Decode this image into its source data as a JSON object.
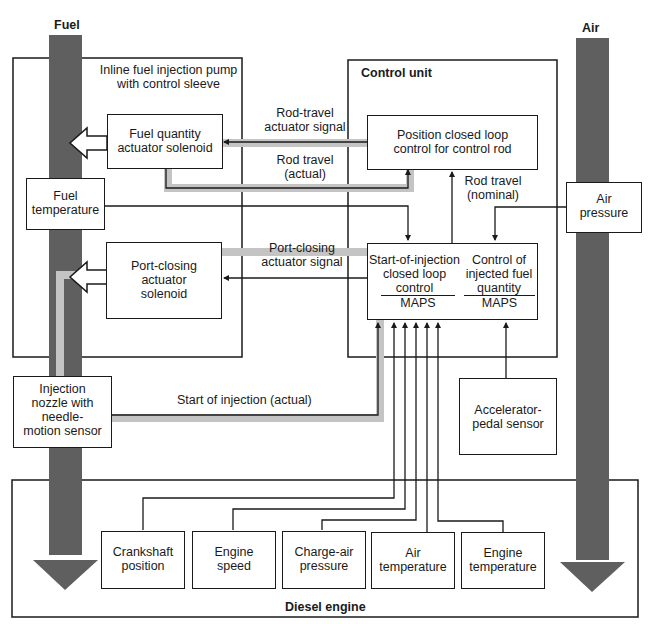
{
  "flows": {
    "fuel_label": "Fuel",
    "air_label": "Air"
  },
  "colors": {
    "flow_arrow": "#5f5f5f",
    "signal_band": "#c4c4c4",
    "line": "#1a1a1a"
  },
  "groups": {
    "pump_title": [
      "Inline fuel injection pump",
      "with control sleeve"
    ],
    "control_unit_title": "Control unit",
    "engine_title": "Diesel engine"
  },
  "blocks": {
    "fuel_quantity_solenoid": [
      "Fuel quantity",
      "actuator solenoid"
    ],
    "port_closing_solenoid": [
      "Port-closing",
      "actuator",
      "solenoid"
    ],
    "fuel_temperature": [
      "Fuel",
      "temperature"
    ],
    "injection_nozzle": [
      "Injection",
      "nozzle with",
      "needle-",
      "motion sensor"
    ],
    "position_control": [
      "Position closed loop",
      "control for control rod"
    ],
    "start_of_injection": [
      "Start-of-injection",
      "closed loop",
      "control"
    ],
    "start_of_injection_maps": "MAPS",
    "injected_fuel_control": [
      "Control of",
      "injected fuel",
      "quantity"
    ],
    "injected_fuel_maps": "MAPS",
    "air_pressure": [
      "Air",
      "pressure"
    ],
    "accelerator_pedal": [
      "Accelerator-",
      "pedal sensor"
    ],
    "crankshaft": [
      "Crankshaft",
      "position"
    ],
    "engine_speed": [
      "Engine",
      "speed"
    ],
    "charge_air": [
      "Charge-air",
      "pressure"
    ],
    "air_temperature": [
      "Air",
      "temperature"
    ],
    "engine_temperature": [
      "Engine",
      "temperature"
    ]
  },
  "signals": {
    "rod_travel_actuator": [
      "Rod-travel",
      "actuator signal"
    ],
    "rod_travel_actual": [
      "Rod travel",
      "(actual)"
    ],
    "rod_travel_nominal": [
      "Rod travel",
      "(nominal)"
    ],
    "port_closing_signal": [
      "Port-closing",
      "actuator signal"
    ],
    "start_of_injection_actual": "Start of injection (actual)"
  }
}
